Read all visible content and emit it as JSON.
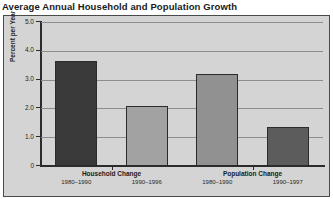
{
  "chart_data": {
    "type": "bar",
    "title": "Average Annual Household and Population Growth",
    "xlabel": "",
    "ylabel": "Percent per Year",
    "ylim": [
      0,
      5.0
    ],
    "ytick_labels": [
      "0",
      "1.0",
      "2.0",
      "3.0",
      "4.0",
      "5.0"
    ],
    "ytick_values": [
      0,
      1.0,
      2.0,
      3.0,
      4.0,
      5.0
    ],
    "grid": true,
    "legend": "none",
    "groups": [
      {
        "label": "Household Change",
        "bars": [
          {
            "label": "1980–1990",
            "value": 3.65,
            "color": "#3a3a3a"
          },
          {
            "label": "1990–1996",
            "value": 2.1,
            "color": "#a2a2a2"
          }
        ]
      },
      {
        "label": "Population Change",
        "bars": [
          {
            "label": "1980–1990",
            "value": 3.2,
            "color": "#919191"
          },
          {
            "label": "1990–1997",
            "value": 1.35,
            "color": "#5c5c5c"
          }
        ]
      }
    ],
    "categories": [
      "Household Change 1980–1990",
      "Household Change 1990–1996",
      "Population Change 1980–1990",
      "Population Change 1990–1997"
    ],
    "values": [
      3.65,
      2.1,
      3.2,
      1.35
    ],
    "colors": {
      "plot_background": "#d4d4d4",
      "frame_border": "#4a4a4a",
      "axis": "#2b2b2b",
      "gridline": "#8d8d8d",
      "text": "#1a1a1a"
    }
  }
}
